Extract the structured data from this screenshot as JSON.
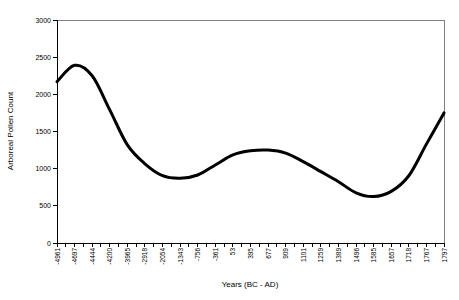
{
  "chart_data": {
    "type": "line",
    "smooth": true,
    "title": "",
    "xlabel": "Years (BC - AD)",
    "ylabel": "Arboreal Pollen Count",
    "categories": [
      "-4961",
      "-4697",
      "-4444",
      "-4200",
      "-3965",
      "-2918",
      "-2054",
      "-1343",
      "-756",
      "-361",
      "53",
      "395",
      "677",
      "909",
      "1101",
      "1259",
      "1389",
      "1496",
      "1585",
      "1657",
      "1718",
      "1767",
      "1797"
    ],
    "values": [
      2170,
      2390,
      2250,
      1790,
      1320,
      1065,
      905,
      870,
      915,
      1050,
      1185,
      1240,
      1250,
      1210,
      1095,
      960,
      825,
      675,
      625,
      695,
      905,
      1330,
      1750
    ],
    "ylim": [
      0,
      3000
    ],
    "yticks": [
      0,
      500,
      1000,
      1500,
      2000,
      2500,
      3000
    ],
    "grid": false,
    "legend": false,
    "x_axis_position": "on-ticks",
    "line_color": "#000000",
    "line_width": 3,
    "axis_color": "#000000",
    "plot_border_color": "#808080",
    "background": "#ffffff"
  }
}
